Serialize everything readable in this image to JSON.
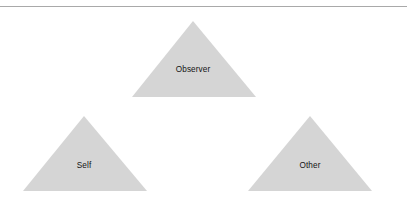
{
  "figure": {
    "name": "self-other-observer-triangle-diagram",
    "width": 414,
    "height": 204,
    "background_color": "#ffffff",
    "rule": {
      "name": "top-horizontal-rule",
      "color": "#a9a9a9",
      "y": 6,
      "x_start": 0,
      "x_end": 407,
      "thickness": 1
    },
    "shape_style": {
      "fill_color": "#d5d5d5",
      "edge": "soft-antialiased",
      "shape": "triangle"
    },
    "label_color": "#141414",
    "triangles": [
      {
        "id": "observer",
        "label": "Observer",
        "icon": "triangle-icon",
        "apex_x": 193,
        "apex_y": 21,
        "base_y": 97,
        "base_left_x": 132,
        "base_right_x": 256,
        "label_x": 193,
        "label_y": 70
      },
      {
        "id": "self",
        "label": "Self",
        "icon": "triangle-icon",
        "apex_x": 84,
        "apex_y": 116,
        "base_y": 191,
        "base_left_x": 23,
        "base_right_x": 147,
        "label_x": 84,
        "label_y": 166
      },
      {
        "id": "other",
        "label": "Other",
        "icon": "triangle-icon",
        "apex_x": 310,
        "apex_y": 116,
        "base_y": 191,
        "base_left_x": 248,
        "base_right_x": 372,
        "label_x": 310,
        "label_y": 166
      }
    ]
  }
}
